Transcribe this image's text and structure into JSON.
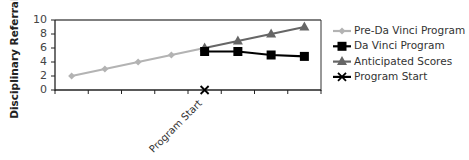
{
  "chart_data": {
    "type": "line",
    "title": "",
    "xlabel": "",
    "ylabel": "Disciplinary Referrals",
    "ylim": [
      0,
      10
    ],
    "yticks": [
      0,
      2,
      4,
      6,
      8,
      10
    ],
    "grid": false,
    "legend_position": "right",
    "x": [
      1,
      2,
      3,
      4,
      5,
      6,
      7,
      8
    ],
    "categories": [
      "",
      "",
      "",
      "",
      "Program Start",
      "",
      "",
      ""
    ],
    "series": [
      {
        "name": "Pre-Da Vinci Program",
        "color": "#b3b3b3",
        "marker": "diamond",
        "values": [
          2,
          3,
          4,
          5,
          6,
          null,
          null,
          null
        ]
      },
      {
        "name": "Da Vinci Program",
        "color": "#000000",
        "marker": "square",
        "values": [
          null,
          null,
          null,
          null,
          5.5,
          5.5,
          5,
          4.8
        ]
      },
      {
        "name": "Anticipated Scores",
        "color": "#666666",
        "marker": "triangle",
        "values": [
          null,
          null,
          null,
          null,
          6,
          7,
          8,
          9
        ]
      },
      {
        "name": "Program Start",
        "color": "#000000",
        "marker": "x",
        "values": [
          null,
          null,
          null,
          null,
          0,
          null,
          null,
          null
        ]
      }
    ],
    "annotations": [
      {
        "text": "Program Start",
        "x_category_index": 4,
        "rotation": -45
      }
    ]
  }
}
